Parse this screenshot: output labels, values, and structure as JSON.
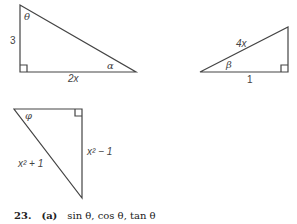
{
  "figures": {
    "triangle1": {
      "side_vertical": "3",
      "side_horizontal": "2x",
      "angle_top": "θ",
      "angle_right": "α"
    },
    "triangle2": {
      "hypotenuse": "4x",
      "side_bottom": "1",
      "angle_left": "β"
    },
    "triangle3": {
      "hypotenuse": "x² + 1",
      "side_vertical": "x² − 1",
      "angle_top": "φ"
    }
  },
  "exercise": {
    "number": "23.",
    "part": "(a)",
    "text": "sin θ, cos θ, tan θ"
  }
}
